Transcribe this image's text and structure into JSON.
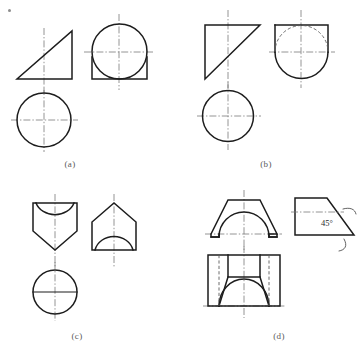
{
  "sheet": {
    "width": 362,
    "height": 351,
    "background": "#ffffff",
    "line_colors": {
      "visible_edge": "#1d1d1d",
      "hidden_edge": "#5c5c5c",
      "center_line": "#7a7a7a",
      "annotation": "#2b2b2b",
      "caption": "#5a5a5a"
    },
    "corner_mark": "bullet-mark"
  },
  "figures": [
    {
      "id": "a",
      "caption": "(a)",
      "description": "Orthographic views of a cone-like solid: front view right triangle, side view circle tangent to a square base, top view circle",
      "views": [
        {
          "name": "front-view",
          "shape": "right-triangle"
        },
        {
          "name": "side-view",
          "shape": "circle-with-square-base"
        },
        {
          "name": "top-view",
          "shape": "circle"
        }
      ]
    },
    {
      "id": "b",
      "caption": "(b)",
      "description": "Orthographic views: front view right triangle with vertical left edge, side view circle with square top and hidden arc, top view circle",
      "views": [
        {
          "name": "front-view",
          "shape": "right-triangle-left-vertical"
        },
        {
          "name": "side-view",
          "shape": "circle-with-square-top-hidden-arc"
        },
        {
          "name": "top-view",
          "shape": "circle"
        }
      ]
    },
    {
      "id": "c",
      "caption": "(c)",
      "description": "Orthographic views: front view shield pentagon with concave top arc, side view house pentagon with semicircular arch, top view circle with horizontal diameter",
      "views": [
        {
          "name": "front-view",
          "shape": "shield-with-concave-arc"
        },
        {
          "name": "side-view",
          "shape": "house-with-arch"
        },
        {
          "name": "top-view",
          "shape": "circle-with-diameter"
        }
      ]
    },
    {
      "id": "d",
      "caption": "(d)",
      "description": "Orthographic views of a chamfered block with semicircular cutout: front view trapezoid with arch, side view trapezoid with 45 degree chamfer, top view rectangle with arch and hidden lines",
      "annotation": "45°",
      "views": [
        {
          "name": "front-view",
          "shape": "trapezoid-with-arch"
        },
        {
          "name": "side-view",
          "shape": "chamfered-trapezoid"
        },
        {
          "name": "top-view",
          "shape": "rectangle-with-arch"
        }
      ]
    }
  ]
}
